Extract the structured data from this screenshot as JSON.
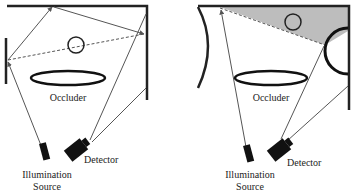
{
  "diagram": {
    "panels": [
      {
        "id": "left",
        "occluder_label": "Occluder",
        "detector_label": "Detector",
        "source_label_line1": "Illumination",
        "source_label_line2": "Source"
      },
      {
        "id": "right",
        "occluder_label": "Occluder",
        "detector_label": "Detector",
        "source_label_line1": "Illumination",
        "source_label_line2": "Source"
      }
    ],
    "colors": {
      "wall": "#222222",
      "ray": "#555555",
      "shadow_fill": "#bdbdbd",
      "device": "#111111"
    }
  }
}
